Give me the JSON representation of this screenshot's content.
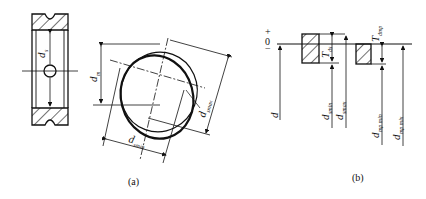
{
  "figure": {
    "panel_a": {
      "caption": "(a)",
      "ring_section": {
        "label_main": "d",
        "label_sub": "s"
      },
      "ellipse_view": {
        "d_m": {
          "main": "d",
          "sub": "m"
        },
        "d_smax": {
          "main": "d",
          "sub": "smax"
        },
        "d_smin": {
          "main": "d",
          "sub": "smin"
        }
      }
    },
    "panel_b": {
      "caption": "(b)",
      "zero_line": {
        "plus": "+",
        "zero": "0",
        "minus": "−"
      },
      "d": {
        "main": "d",
        "sub": ""
      },
      "Tds": {
        "main": "T",
        "sub": "ds"
      },
      "Tdmp": {
        "main": "T",
        "sub": "dmp"
      },
      "d_smin": {
        "main": "d",
        "sub": "smin"
      },
      "d_smax": {
        "main": "d",
        "sub": "smax"
      },
      "d_mpmin": {
        "main": "d",
        "sub": "mp min"
      },
      "d_mpmax": {
        "main": "d",
        "sub": "mp mix"
      }
    }
  }
}
